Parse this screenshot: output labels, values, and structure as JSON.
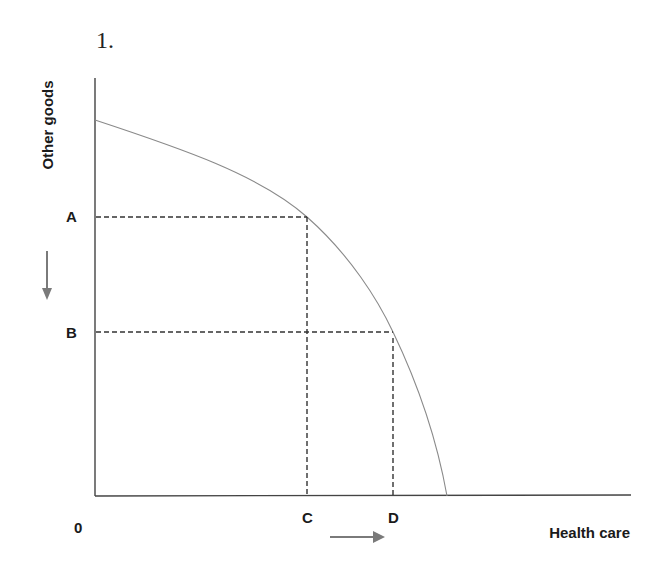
{
  "question_number": "1.",
  "axes": {
    "y_label": "Other goods",
    "x_label": "Health care",
    "origin_label": "0"
  },
  "points": {
    "y_levels": [
      {
        "label": "A",
        "description": "higher level of other goods"
      },
      {
        "label": "B",
        "description": "lower level of other goods"
      }
    ],
    "x_levels": [
      {
        "label": "C",
        "description": "health care paired with A"
      },
      {
        "label": "D",
        "description": "health care paired with B"
      }
    ]
  },
  "arrows": {
    "y_arrow": {
      "direction": "down",
      "meaning": "decrease in other goods (A to B)"
    },
    "x_arrow": {
      "direction": "right",
      "meaning": "increase in health care (C to D)"
    }
  },
  "curve": {
    "type": "production possibilities frontier",
    "shape": "concave to origin"
  },
  "colors": {
    "axis": "#333333",
    "curve": "#8a8a8a",
    "dashed": "#333333",
    "arrow": "#7a7a7a",
    "text": "#1a1a1a"
  }
}
